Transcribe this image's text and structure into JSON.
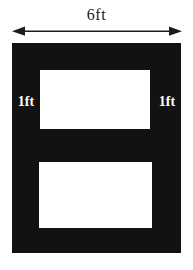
{
  "figure": {
    "width_label": "6ft",
    "left_thickness_label": "1ft",
    "right_thickness_label": "1ft"
  },
  "colors": {
    "background": "#ffffff",
    "shape-fill": "#121212",
    "cutout-fill": "#ffffff",
    "arrow-color": "#1c1c1c",
    "label-on-shape": "#ffffff",
    "label-on-bg": "#1c1c1c"
  }
}
